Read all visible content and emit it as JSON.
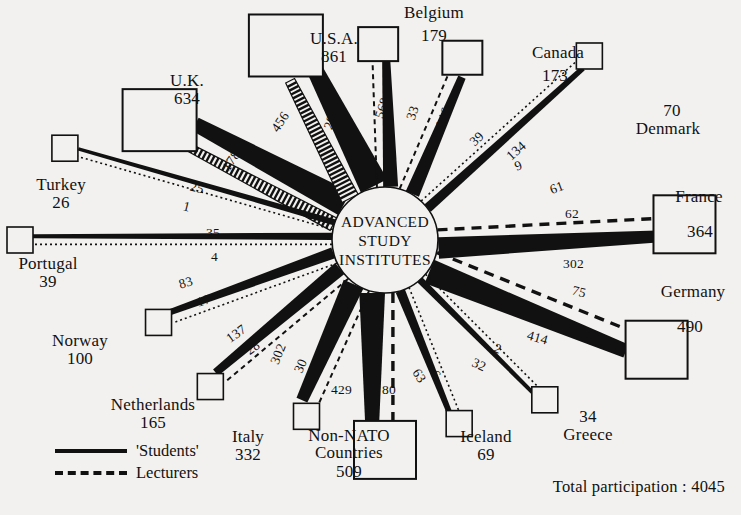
{
  "diagram": {
    "title": "ADVANCED STUDY INSTITUTES",
    "hub_lines": [
      "ADVANCED",
      "STUDY",
      "INSTITUTES"
    ],
    "legend": {
      "students_label": "'Students'",
      "lecturers_label": "Lecturers"
    },
    "total_label": "Total participation : 4045",
    "colors": {
      "ink": "#111111",
      "background": "#f3f1ef"
    }
  },
  "chart_data": {
    "type": "diagram",
    "title": "ADVANCED STUDY INSTITUTES",
    "center": "ADVANCED STUDY INSTITUTES",
    "total_participation": 4045,
    "series": [
      {
        "name": "'Students'",
        "style": "solid"
      },
      {
        "name": "Lecturers",
        "style": "dashed"
      }
    ],
    "nodes": [
      {
        "country": "U.K.",
        "total": 634,
        "students": 456,
        "lecturers": 178,
        "angle_deg": 208,
        "boxed": true
      },
      {
        "country": "U.S.A.",
        "total": 861,
        "students": 568,
        "lecturers": 293,
        "angle_deg": 243,
        "boxed": true
      },
      {
        "country": "Belgium",
        "total": 179,
        "students": 146,
        "lecturers": 33,
        "angle_deg": 268,
        "boxed": true
      },
      {
        "country": "Canada",
        "total": 173,
        "students": 134,
        "lecturers": 39,
        "angle_deg": 293,
        "boxed": true
      },
      {
        "country": "Denmark",
        "total": 70,
        "students": 61,
        "lecturers": 9,
        "angle_deg": 318,
        "boxed": false
      },
      {
        "country": "France",
        "total": 364,
        "students": 302,
        "lecturers": 62,
        "angle_deg": 357,
        "boxed": true
      },
      {
        "country": "Germany",
        "total": 490,
        "students": 414,
        "lecturers": 75,
        "angle_deg": 22,
        "boxed": true
      },
      {
        "country": "Greece",
        "total": 34,
        "students": 32,
        "lecturers": 2,
        "angle_deg": 45,
        "boxed": false
      },
      {
        "country": "Iceland",
        "total": 69,
        "students": 63,
        "lecturers": 6,
        "angle_deg": 68,
        "boxed": false
      },
      {
        "country": "Non-NATO Countries",
        "total": 509,
        "students": 429,
        "lecturers": 80,
        "angle_deg": 90,
        "boxed": true
      },
      {
        "country": "Italy",
        "total": 332,
        "students": 302,
        "lecturers": 30,
        "angle_deg": 114,
        "boxed": false
      },
      {
        "country": "Netherlands",
        "total": 165,
        "students": 137,
        "lecturers": 28,
        "angle_deg": 140,
        "boxed": false
      },
      {
        "country": "Norway",
        "total": 100,
        "students": 83,
        "lecturers": 17,
        "angle_deg": 160,
        "boxed": false
      },
      {
        "country": "Portugal",
        "total": 39,
        "students": 35,
        "lecturers": 4,
        "angle_deg": 180,
        "boxed": false
      },
      {
        "country": "Turkey",
        "total": 26,
        "students": 25,
        "lecturers": 1,
        "angle_deg": 196,
        "boxed": false
      }
    ]
  },
  "labels": {
    "uk": {
      "name": "U.K.",
      "value": "634"
    },
    "usa": {
      "name": "U.S.A.",
      "value": "861"
    },
    "belgium": {
      "name": "Belgium",
      "value": "179"
    },
    "canada": {
      "name": "Canada",
      "value": "173"
    },
    "denmark": {
      "name": "Denmark",
      "value": "70"
    },
    "france": {
      "name": "France",
      "value": "364"
    },
    "germany": {
      "name": "Germany",
      "value": "490"
    },
    "greece": {
      "name": "Greece",
      "value": "34"
    },
    "iceland": {
      "name": "Iceland",
      "value": "69"
    },
    "nonnato": {
      "name": "Non-NATO",
      "name2": "Countries",
      "value": "509"
    },
    "italy": {
      "name": "Italy",
      "value": "332"
    },
    "netherlands": {
      "name": "Netherlands",
      "value": "165"
    },
    "norway": {
      "name": "Norway",
      "value": "100"
    },
    "portugal": {
      "name": "Portugal",
      "value": "39"
    },
    "turkey": {
      "name": "Turkey",
      "value": "26"
    }
  },
  "flows": {
    "uk_students": "456",
    "uk_lecturers": "178",
    "usa_students": "568",
    "usa_lecturers": "293",
    "belgium_students": "146",
    "belgium_lecturers": "33",
    "canada_students": "134",
    "canada_lecturers": "39",
    "denmark_students": "61",
    "denmark_lecturers": "9",
    "france_students": "302",
    "france_lecturers": "62",
    "germany_students": "414",
    "germany_lecturers": "75",
    "greece_students": "32",
    "greece_lecturers": "2",
    "iceland_students": "63",
    "iceland_lecturers": "6",
    "nonnato_students": "429",
    "nonnato_lecturers": "80",
    "italy_students": "302",
    "italy_lecturers": "30",
    "netherlands_students": "137",
    "netherlands_lecturers": "28",
    "norway_students": "83",
    "norway_lecturers": "17",
    "portugal_students": "35",
    "portugal_lecturers": "4",
    "turkey_students": "25",
    "turkey_lecturers": "1"
  }
}
